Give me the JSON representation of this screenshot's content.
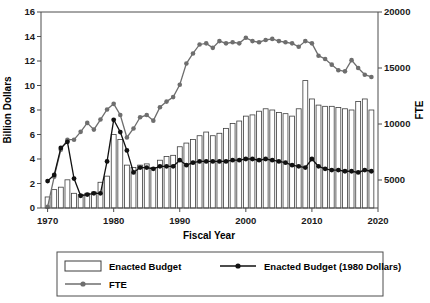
{
  "chart_data": {
    "type": "bar",
    "title": "",
    "xlabel": "Fiscal Year",
    "ylabel": "Billion Dollars",
    "y2label": "FTE",
    "xlim": [
      1969,
      2020
    ],
    "ylim": [
      0,
      16
    ],
    "y2lim": [
      2500,
      20000
    ],
    "xticks": [
      1970,
      1980,
      1990,
      2000,
      2010,
      2020
    ],
    "yticks": [
      0,
      2,
      4,
      6,
      8,
      10,
      12,
      14,
      16
    ],
    "y2ticks": [
      5000,
      10000,
      15000,
      20000
    ],
    "grid": false,
    "legend_position": "bottom",
    "x": [
      1970,
      1971,
      1972,
      1973,
      1974,
      1975,
      1976,
      1977,
      1978,
      1979,
      1980,
      1981,
      1982,
      1983,
      1984,
      1985,
      1986,
      1987,
      1988,
      1989,
      1990,
      1991,
      1992,
      1993,
      1994,
      1995,
      1996,
      1997,
      1998,
      1999,
      2000,
      2001,
      2002,
      2003,
      2004,
      2005,
      2006,
      2007,
      2008,
      2009,
      2010,
      2011,
      2012,
      2013,
      2014,
      2015,
      2016,
      2017,
      2018,
      2019
    ],
    "series": [
      {
        "name": "Enacted Budget",
        "type": "bar",
        "axis": "left",
        "units": "Billion Dollars",
        "values": [
          0.9,
          1.5,
          1.7,
          2.3,
          1.2,
          1.1,
          1.2,
          1.3,
          2.1,
          2.6,
          6.0,
          5.6,
          3.5,
          3.3,
          3.5,
          3.6,
          3.3,
          3.9,
          4.2,
          4.3,
          5.0,
          5.3,
          5.6,
          5.9,
          6.2,
          5.9,
          6.1,
          6.5,
          6.9,
          7.1,
          7.5,
          7.6,
          7.9,
          8.1,
          8.0,
          7.8,
          7.7,
          7.5,
          8.1,
          10.4,
          8.9,
          8.4,
          8.3,
          8.3,
          8.2,
          8.1,
          8.0,
          8.7,
          8.9,
          8.0
        ]
      },
      {
        "name": "Enacted Budget (1980 Dollars)",
        "type": "line",
        "axis": "left",
        "units": "Billion Dollars",
        "values": [
          2.2,
          2.7,
          4.9,
          5.4,
          2.4,
          1.0,
          1.1,
          1.2,
          1.2,
          3.8,
          7.2,
          6.2,
          4.7,
          2.9,
          3.3,
          3.3,
          3.2,
          3.4,
          3.4,
          3.4,
          3.9,
          3.5,
          3.7,
          3.8,
          3.8,
          3.8,
          3.8,
          3.8,
          3.9,
          3.9,
          4.0,
          4.0,
          3.9,
          4.0,
          3.9,
          3.8,
          3.7,
          3.5,
          3.4,
          3.3,
          4.0,
          3.4,
          3.2,
          3.1,
          3.1,
          3.0,
          3.0,
          2.9,
          3.1,
          3.0
        ]
      },
      {
        "name": "FTE",
        "type": "line",
        "axis": "right",
        "units": "FTE",
        "values": [
          2600,
          5300,
          7700,
          8600,
          8600,
          9300,
          10100,
          9500,
          10400,
          11300,
          11800,
          10800,
          8800,
          9600,
          10600,
          10800,
          10300,
          11500,
          12000,
          12400,
          13500,
          15400,
          16300,
          17100,
          17200,
          16800,
          17400,
          17200,
          17300,
          17200,
          17700,
          17400,
          17300,
          17500,
          17600,
          17400,
          17300,
          17200,
          16900,
          17400,
          17200,
          16100,
          15800,
          15300,
          14800,
          14700,
          15700,
          15000,
          14400,
          14200
        ]
      }
    ]
  },
  "legend": {
    "items": [
      {
        "label": "Enacted Budget",
        "marker": "rect-outline",
        "color": "#ffffff"
      },
      {
        "label": "Enacted Budget (1980 Dollars)",
        "marker": "line-point",
        "color": "#111111"
      },
      {
        "label": "FTE",
        "marker": "line-point",
        "color": "#6e6e6e"
      }
    ]
  }
}
